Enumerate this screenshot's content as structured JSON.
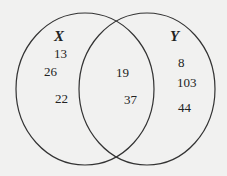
{
  "diagram": {
    "type": "venn",
    "sets": [
      {
        "name": "X",
        "only_values": [
          "13",
          "26",
          "22"
        ]
      },
      {
        "name": "Y",
        "only_values": [
          "8",
          "103",
          "44"
        ]
      }
    ],
    "intersection_values": [
      "19",
      "37"
    ],
    "colors": {
      "stroke": "#333333",
      "background": "#f1f1f0",
      "text": "#222222"
    }
  }
}
